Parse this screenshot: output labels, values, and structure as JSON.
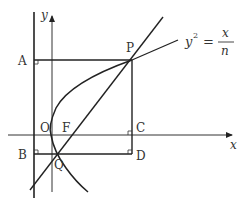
{
  "diagram": {
    "equation": {
      "lhs": "y",
      "exp": "2",
      "eq": "=",
      "num": "x",
      "den": "n"
    },
    "axes": {
      "x_label": "x",
      "y_label": "y"
    },
    "points": {
      "A": "A",
      "P": "P",
      "O": "O",
      "F": "F",
      "C": "C",
      "B": "B",
      "Q": "Q",
      "D": "D"
    },
    "colors": {
      "stroke": "#222222",
      "text": "#333333",
      "background": "#ffffff"
    }
  }
}
